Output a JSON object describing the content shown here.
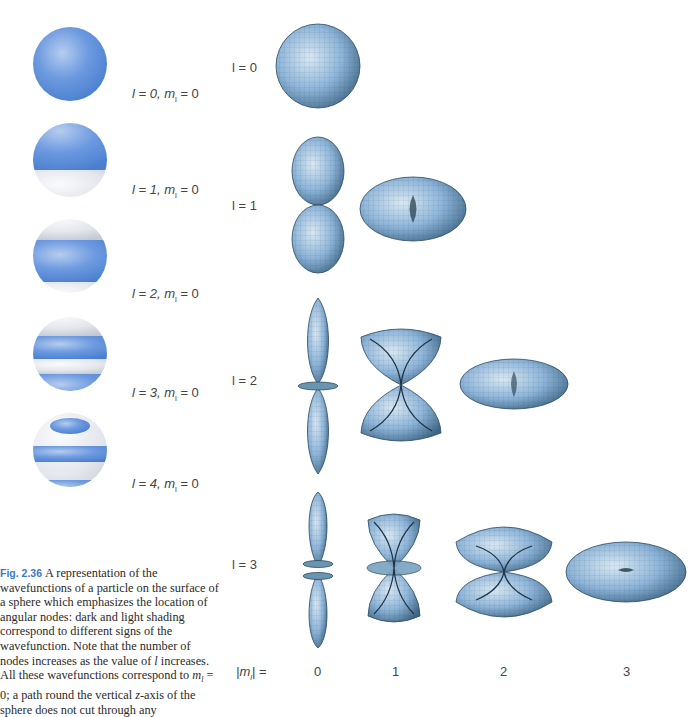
{
  "left_panel": {
    "spheres": [
      {
        "l": "0",
        "ml": "0",
        "label_l": "l = 0,",
        "label_m": "m",
        "label_sub": "l",
        "label_val": " = 0"
      },
      {
        "l": "1",
        "ml": "0",
        "label_l": "l = 1,",
        "label_m": "m",
        "label_sub": "l",
        "label_val": " = 0"
      },
      {
        "l": "2",
        "ml": "0",
        "label_l": "l = 2,",
        "label_m": "m",
        "label_sub": "l",
        "label_val": " = 0"
      },
      {
        "l": "3",
        "ml": "0",
        "label_l": "l = 3,",
        "label_m": "m",
        "label_sub": "l",
        "label_val": " = 0"
      },
      {
        "l": "4",
        "ml": "0",
        "label_l": "l = 4,",
        "label_m": "m",
        "label_sub": "l",
        "label_val": " = 0"
      }
    ]
  },
  "caption": {
    "fig_number": "Fig. 2.36",
    "text": "A representation of the wavefunctions of a particle on the surface of a sphere which emphasizes the location of angular nodes: dark and light shading correspond to different signs of the wavefunction. Note that the number of nodes increases as the value of l increases. All these wavefunctions correspond to m_l = 0; a path round the vertical z-axis of the sphere does not cut through any"
  },
  "caption_parts": {
    "p1": "A representation of the wavefunctions of a particle on the surface of a sphere which emphasizes the location of angular nodes: dark and light shading correspond to different signs of the wavefunction. Note that the number of nodes increases as the value of ",
    "l": "l",
    "p2": " increases. All these wavefunctions correspond to ",
    "m": "m",
    "sub": "l",
    "p3": " = 0; a path round the vertical ",
    "z": "z",
    "p4": "-axis of the sphere does not cut through any"
  },
  "right_panel": {
    "row_labels": [
      "l = 0",
      "l = 1",
      "l = 2",
      "l = 3"
    ],
    "column_header_label": "|m",
    "column_header_sub": "l",
    "column_header_suffix": "| =",
    "columns": [
      "0",
      "1",
      "2",
      "3"
    ]
  },
  "colors": {
    "sphere_blue": "#5b8fd6",
    "sphere_light": "#e8ecf2",
    "orbital_fill": "#8fb5d9",
    "caption_fig": "#3a7ac8"
  }
}
